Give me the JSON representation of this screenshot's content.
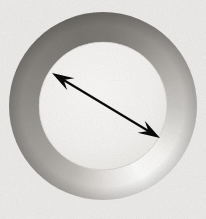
{
  "figure": {
    "title": "Annulus with inner-diameter arrow",
    "subject_name": "metal washer ring",
    "alt_text": "A grey metallic annulus (flat ring washer) photographed on a light grey background, with a black double-headed arrow drawn across its inner opening indicating the inner diameter.",
    "canvas": {
      "width": 206,
      "height": 219,
      "background_color": "#ecebe9",
      "has_grain_texture": "true"
    },
    "ring": {
      "shape_name": "annulus",
      "center_x": 103,
      "center_y": 106,
      "outer_radius": 94,
      "inner_radius": 64,
      "band_thickness": 30,
      "outer_bbox": "13,12 to 197,200",
      "inner_bbox": "39,42 to 167,170",
      "material": "brushed metal",
      "shading_type": "conic-gradient",
      "gradient_stops": [
        {
          "angle_deg": 0,
          "color": "#c9c7c4"
        },
        {
          "angle_deg": 38,
          "color": "#f4f3f1"
        },
        {
          "angle_deg": 62,
          "color": "#fbfbfa"
        },
        {
          "angle_deg": 88,
          "color": "#e3e1de"
        },
        {
          "angle_deg": 112,
          "color": "#bfbcb8"
        },
        {
          "angle_deg": 140,
          "color": "#a5a29e"
        },
        {
          "angle_deg": 170,
          "color": "#96938f"
        },
        {
          "angle_deg": 196,
          "color": "#8b8884"
        },
        {
          "angle_deg": 224,
          "color": "#7f7c78"
        },
        {
          "angle_deg": 252,
          "color": "#77746f"
        },
        {
          "angle_deg": 276,
          "color": "#7c7975"
        },
        {
          "angle_deg": 300,
          "color": "#8e8b87"
        },
        {
          "angle_deg": 322,
          "color": "#a8a5a1"
        },
        {
          "angle_deg": 344,
          "color": "#bebbb7"
        },
        {
          "angle_deg": 360,
          "color": "#c9c7c4"
        }
      ],
      "inner_fill_color": "#f3f2f0",
      "edge_shadow_color": "#b4b1ad"
    },
    "arrow": {
      "label": "inner diameter",
      "style": "double-headed",
      "color": "#0a0a0a",
      "stroke_width": 2.2,
      "start_x": 52,
      "start_y": 73,
      "end_x": 160,
      "end_y": 138,
      "head_length": 22,
      "head_half_width": 7,
      "angle_deg": 31
    },
    "annotations": {
      "dimension_text": "",
      "units": ""
    }
  }
}
